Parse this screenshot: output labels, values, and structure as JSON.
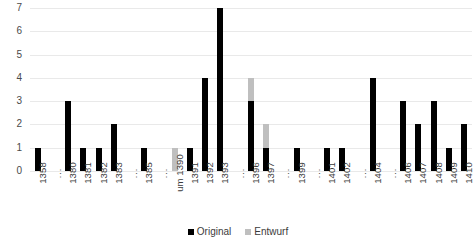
{
  "chart_data": {
    "type": "bar",
    "stacked": true,
    "title": "",
    "subtitle": "",
    "xlabel": "",
    "ylabel": "",
    "ylim": [
      0,
      7
    ],
    "yticks": [
      0,
      1,
      2,
      3,
      4,
      5,
      6,
      7
    ],
    "grid": true,
    "legend_position": "bottom-center",
    "categories": [
      "1358",
      "⋮",
      "1380",
      "1381",
      "1382",
      "1383",
      "⋮",
      "1385",
      "⋮",
      "um 1390",
      "1391",
      "1392",
      "1393",
      "⋮",
      "1396",
      "1397",
      "⋮",
      "1399",
      "⋮",
      "1401",
      "1402",
      "⋮",
      "1404",
      "⋮",
      "1406",
      "1407",
      "1408",
      "1409",
      "1410"
    ],
    "series": [
      {
        "name": "Original",
        "color": "#000000",
        "values": [
          1,
          0,
          3,
          1,
          1,
          2,
          0,
          1,
          0,
          0,
          1,
          4,
          7,
          0,
          3,
          1,
          0,
          1,
          0,
          1,
          1,
          0,
          4,
          0,
          3,
          2,
          3,
          1,
          2
        ]
      },
      {
        "name": "Entwurf",
        "color": "#bfbfbf",
        "values": [
          0,
          0,
          0,
          0,
          0,
          0,
          0,
          0,
          0,
          1,
          0,
          0,
          0,
          0,
          1,
          1,
          0,
          0,
          0,
          0,
          0,
          0,
          0,
          0,
          0,
          0,
          0,
          0,
          0
        ]
      }
    ],
    "totals": [
      1,
      0,
      3,
      1,
      1,
      2,
      0,
      1,
      0,
      1,
      1,
      4,
      7,
      0,
      4,
      2,
      0,
      1,
      0,
      1,
      1,
      0,
      4,
      0,
      3,
      2,
      3,
      1,
      2
    ]
  },
  "legend": {
    "items": [
      {
        "label": "Original",
        "color": "#000000"
      },
      {
        "label": "Entwurf",
        "color": "#bfbfbf"
      }
    ]
  },
  "colors": {
    "original": "#000000",
    "entwurf": "#bfbfbf",
    "gridline": "#e9e9e9",
    "text": "#3b3b3b",
    "background": "#ffffff"
  }
}
